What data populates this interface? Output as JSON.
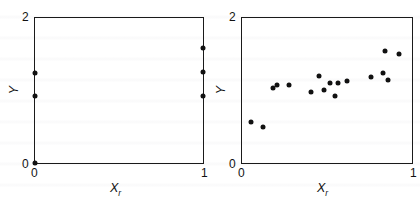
{
  "figure": {
    "background_color": "#ffffff",
    "ink_color": "#111111"
  },
  "chart_data": [
    {
      "type": "scatter",
      "panel": "left",
      "title": "",
      "xlabel": "X_r",
      "ylabel": "Y",
      "xlim": [
        0,
        1
      ],
      "ylim": [
        0,
        2
      ],
      "xticks": [
        0,
        1
      ],
      "xticklabels": [
        "0",
        "1"
      ],
      "yticks": [
        0,
        2
      ],
      "yticklabels": [
        "0",
        "2"
      ],
      "grid": false,
      "legend": null,
      "x": [
        0.0,
        0.0,
        0.0,
        1.0,
        1.0,
        1.0
      ],
      "y": [
        0.0,
        0.93,
        1.24,
        0.93,
        1.25,
        1.58
      ],
      "note": "all observations lie on the two extreme values of Xr (0 and 1)"
    },
    {
      "type": "scatter",
      "panel": "right",
      "title": "",
      "xlabel": "X_r",
      "ylabel": "Y",
      "xlim": [
        0,
        1
      ],
      "ylim": [
        0,
        2
      ],
      "xticks": [
        0,
        1
      ],
      "xticklabels": [
        "0",
        "1"
      ],
      "yticks": [
        0,
        2
      ],
      "yticklabels": [
        "0",
        "2"
      ],
      "grid": false,
      "legend": null,
      "x": [
        0.055,
        0.125,
        0.185,
        0.205,
        0.275,
        0.405,
        0.455,
        0.485,
        0.52,
        0.545,
        0.565,
        0.62,
        0.76,
        0.83,
        0.84,
        0.86,
        0.925
      ],
      "y": [
        0.565,
        0.495,
        1.03,
        1.07,
        1.075,
        0.985,
        1.195,
        1.01,
        1.105,
        0.93,
        1.11,
        1.135,
        1.18,
        1.235,
        1.54,
        1.14,
        1.505
      ],
      "note": "positively sloped cloud of observations spread across the full range of Xr"
    }
  ],
  "labels": {
    "x_axis_base": "X",
    "x_axis_sub": "r",
    "y_axis": "Y",
    "tick_zero": "0",
    "tick_two": "2",
    "tick_one": "1"
  }
}
